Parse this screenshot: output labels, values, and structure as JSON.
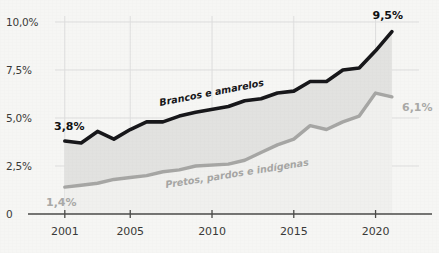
{
  "chart_data": {
    "type": "line",
    "title": "",
    "subtitle": "",
    "xlabel": "",
    "ylabel": "",
    "x": [
      2001,
      2002,
      2003,
      2004,
      2005,
      2006,
      2007,
      2008,
      2009,
      2011,
      2012,
      2013,
      2014,
      2015,
      2016,
      2017,
      2018,
      2019,
      2020,
      2021
    ],
    "xlim": [
      2000.4,
      2021.8
    ],
    "ylim": [
      0,
      10.0
    ],
    "xticks": [
      2001,
      2005,
      2010,
      2015,
      2020
    ],
    "xtick_labels": [
      "2001",
      "2005",
      "2010",
      "2015",
      "2020"
    ],
    "yticks": [
      0,
      2.5,
      5.0,
      7.5,
      10.0
    ],
    "ytick_labels": [
      "0",
      "2,5%",
      "5,0%",
      "7,5%",
      "10,0%"
    ],
    "grid": true,
    "legend_position": "inline-annotation",
    "series": [
      {
        "name": "Brancos e amarelos",
        "color": "#17171a",
        "area_fill": "#e2e2e0",
        "start_label": "3,8%",
        "end_label": "9,5%",
        "values": [
          3.8,
          3.7,
          4.3,
          3.9,
          4.4,
          4.8,
          4.8,
          5.1,
          5.3,
          5.6,
          5.9,
          6.0,
          6.3,
          6.4,
          6.9,
          6.9,
          7.5,
          7.6,
          8.5,
          9.5
        ]
      },
      {
        "name": "Pretos, pardos e indígenas",
        "color": "#a6a6a4",
        "area_fill": "#e8e8e6",
        "start_label": "1,4%",
        "end_label": "6,1%",
        "values": [
          1.4,
          1.5,
          1.6,
          1.8,
          1.9,
          2.0,
          2.2,
          2.3,
          2.5,
          2.6,
          2.8,
          3.2,
          3.6,
          3.9,
          4.6,
          4.4,
          4.8,
          5.1,
          6.3,
          6.1
        ]
      }
    ],
    "annotations": [
      {
        "text": "Brancos e amarelos",
        "series": 0,
        "rotation": -11
      },
      {
        "text": "Pretos, pardos e indígenas",
        "series": 1,
        "rotation": -9
      }
    ]
  },
  "axis": {
    "y_labels": [
      "10,0%",
      "7,5%",
      "5,0%",
      "2,5%",
      "0"
    ],
    "x_labels": [
      "2001",
      "2005",
      "2010",
      "2015",
      "2020"
    ]
  },
  "labels": {
    "dark_series_name": "Brancos e amarelos",
    "gray_series_name": "Pretos, pardos e indígenas",
    "dark_start_value": "3,8%",
    "dark_end_value": "9,5%",
    "gray_start_value": "1,4%",
    "gray_end_value": "6,1%"
  },
  "colors": {
    "background": "#f6f6f4",
    "dark_series": "#17171a",
    "gray_series": "#a6a6a4",
    "area_fill": "#e3e3e1",
    "grid": "#dedede",
    "axis": "#4a4a48"
  }
}
